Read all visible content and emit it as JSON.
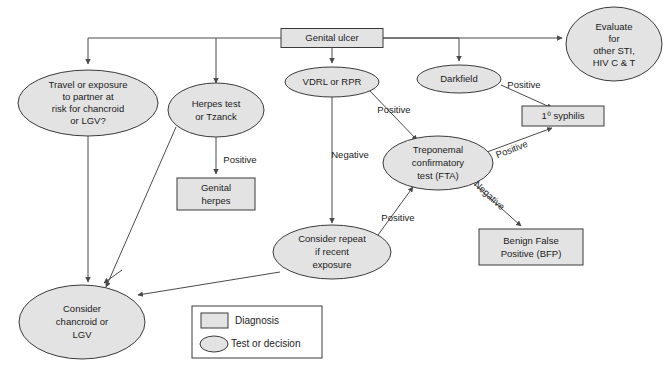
{
  "diagram": {
    "colors": {
      "shape_fill": "#e3e3e3",
      "shape_stroke": "#3a3a3a",
      "connector": "#4a4a4a",
      "text": "#1b1b1b",
      "background": "#ffffff"
    },
    "nodes": [
      {
        "id": "genital_ulcer",
        "kind": "box",
        "lines": [
          "Genital ulcer"
        ],
        "cx": 332,
        "cy": 38,
        "w": 102,
        "h": 19
      },
      {
        "id": "travel_exposure",
        "kind": "ellipse",
        "lines": [
          "Travel or exposure",
          "to partner at",
          "risk for chancroid",
          "or LGV?"
        ],
        "cx": 88,
        "cy": 103,
        "w": 140,
        "h": 66
      },
      {
        "id": "herpes_test",
        "kind": "ellipse",
        "lines": [
          "Herpes test",
          "or Tzanck"
        ],
        "cx": 216,
        "cy": 110,
        "w": 96,
        "h": 46
      },
      {
        "id": "vdrl_rpr",
        "kind": "ellipse",
        "lines": [
          "VDRL or RPR"
        ],
        "cx": 332,
        "cy": 82,
        "w": 94,
        "h": 30
      },
      {
        "id": "darkfield",
        "kind": "ellipse",
        "lines": [
          "Darkfield"
        ],
        "cx": 459,
        "cy": 79,
        "w": 84,
        "h": 27
      },
      {
        "id": "evaluate_other_sti",
        "kind": "ellipse",
        "lines": [
          "Evaluate",
          "for",
          "other STI,",
          "HIV C & T"
        ],
        "cx": 614,
        "cy": 44,
        "w": 96,
        "h": 72
      },
      {
        "id": "primary_syphilis",
        "kind": "box",
        "lines": [
          "1⁰ syphilis"
        ],
        "cx": 563,
        "cy": 116,
        "w": 82,
        "h": 20
      },
      {
        "id": "treponemal_fta",
        "kind": "ellipse",
        "lines": [
          "Treponemal",
          "confirmatory",
          "test (FTA)"
        ],
        "cx": 438,
        "cy": 163,
        "w": 110,
        "h": 54
      },
      {
        "id": "genital_herpes",
        "kind": "box",
        "lines": [
          "Genital",
          "herpes"
        ],
        "cx": 216,
        "cy": 194,
        "w": 78,
        "h": 32
      },
      {
        "id": "consider_repeat",
        "kind": "ellipse",
        "lines": [
          "Consider repeat",
          "if recent",
          "exposure"
        ],
        "cx": 332,
        "cy": 252,
        "w": 118,
        "h": 54
      },
      {
        "id": "benign_false_positive",
        "kind": "box",
        "lines": [
          "Benign False",
          "Positive (BFP)"
        ],
        "cx": 531,
        "cy": 247,
        "w": 104,
        "h": 36
      },
      {
        "id": "consider_chancroid",
        "kind": "ellipse",
        "lines": [
          "Consider",
          "chancroid or",
          "LGV"
        ],
        "cx": 82,
        "cy": 322,
        "w": 126,
        "h": 72
      }
    ],
    "edge_labels": [
      {
        "id": "vdrl_positive",
        "text": "Positive",
        "x": 394,
        "y": 110
      },
      {
        "id": "vdrl_negative",
        "text": "Negative",
        "x": 350,
        "y": 155
      },
      {
        "id": "herpes_positive",
        "text": "Positive",
        "x": 240,
        "y": 160
      },
      {
        "id": "darkfield_positive",
        "text": "Positive",
        "x": 524,
        "y": 85
      },
      {
        "id": "fta_positive_syph",
        "text": "Positive",
        "x": 512,
        "y": 150,
        "rotate": -26
      },
      {
        "id": "repeat_positive",
        "text": "Positive",
        "x": 395,
        "y": 218,
        "rotate": 0
      },
      {
        "id": "fta_negative",
        "text": "Negative",
        "x": 489,
        "y": 195,
        "rotate": 43
      }
    ],
    "legend": {
      "items": [
        {
          "id": "legend-diagnosis",
          "shape": "box",
          "label": "Diagnosis"
        },
        {
          "id": "legend-test-decision",
          "shape": "ellipse",
          "label": "Test or decision"
        }
      ]
    }
  }
}
